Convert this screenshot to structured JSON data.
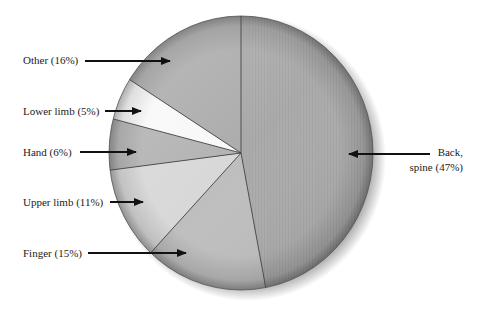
{
  "chart_data": {
    "type": "pie",
    "title": "",
    "categories": [
      "Back, spine",
      "Finger",
      "Upper limb",
      "Hand",
      "Lower limb",
      "Other"
    ],
    "values": [
      47,
      15,
      11,
      6,
      5,
      16
    ],
    "unit": "%",
    "start_angle_deg": 0,
    "direction": "clockwise",
    "labels": [
      {
        "text": "Back,",
        "text2": "spine (47%)"
      },
      {
        "text": "Finger (15%)"
      },
      {
        "text": "Upper limb (11%)"
      },
      {
        "text": "Hand (6%)"
      },
      {
        "text": "Lower limb (5%)"
      },
      {
        "text": "Other (16%)"
      }
    ],
    "colors": [
      "#ababab",
      "#bebebe",
      "#d8d8d8",
      "#b3b3b3",
      "#f8f8f8",
      "#acacac"
    ],
    "legend": "none, direct labels with arrows"
  }
}
